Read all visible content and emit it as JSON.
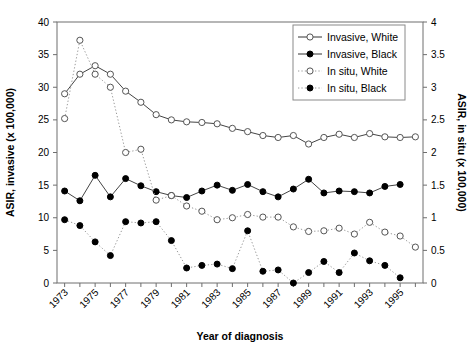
{
  "chart_data": {
    "type": "line",
    "title": "",
    "xlabel": "Year of diagnosis",
    "ylabel": "ASIR, invasive (x 100,000)",
    "y2label": "ASIR, in situ (x 100,000)",
    "x": [
      1973,
      1974,
      1975,
      1976,
      1977,
      1978,
      1979,
      1980,
      1981,
      1982,
      1983,
      1984,
      1985,
      1986,
      1987,
      1988,
      1989,
      1990,
      1991,
      1992,
      1993,
      1994,
      1995,
      1996
    ],
    "xlim": [
      1972.5,
      1996.5
    ],
    "ylim": [
      0,
      40
    ],
    "y2lim": [
      0,
      4
    ],
    "yticks": [
      0,
      5,
      10,
      15,
      20,
      25,
      30,
      35,
      40
    ],
    "y2ticks": [
      0,
      0.5,
      1,
      1.5,
      2,
      2.5,
      3,
      3.5,
      4
    ],
    "xticklabels": [
      "1973",
      "",
      "1975",
      "",
      "1977",
      "",
      "1979",
      "",
      "1981",
      "",
      "1983",
      "",
      "1985",
      "",
      "1987",
      "",
      "1989",
      "",
      "1991",
      "",
      "1993",
      "",
      "1995",
      ""
    ],
    "grid": false,
    "legend_position": "top-right",
    "series": [
      {
        "name": "Invasive, White",
        "axis": "left",
        "line": "solid",
        "marker": "open-circle",
        "values": [
          29.0,
          32.0,
          33.3,
          32.0,
          29.4,
          27.7,
          25.8,
          25.0,
          24.7,
          24.6,
          24.4,
          23.7,
          23.2,
          22.6,
          22.3,
          22.6,
          21.3,
          22.3,
          22.8,
          22.3,
          22.9,
          22.4,
          22.3,
          22.4
        ]
      },
      {
        "name": "Invasive, Black",
        "axis": "left",
        "line": "solid",
        "marker": "filled-circle",
        "values": [
          14.1,
          12.6,
          16.5,
          13.2,
          16.0,
          14.9,
          14.0,
          13.4,
          13.1,
          14.1,
          15.0,
          14.2,
          15.1,
          14.0,
          13.2,
          14.4,
          15.9,
          13.8,
          14.1,
          14.0,
          13.8,
          14.8,
          15.1,
          null
        ]
      },
      {
        "name": "In situ, White",
        "axis": "right",
        "line": "dotted",
        "marker": "open-circle",
        "values": [
          2.52,
          3.72,
          3.2,
          3.0,
          2.0,
          2.05,
          1.27,
          1.34,
          1.18,
          1.1,
          0.97,
          1.0,
          1.05,
          1.01,
          1.01,
          0.86,
          0.79,
          0.8,
          0.84,
          0.75,
          0.93,
          0.78,
          0.72,
          0.55
        ]
      },
      {
        "name": "In situ, Black",
        "axis": "right",
        "line": "dotted",
        "marker": "filled-circle",
        "values": [
          0.97,
          0.88,
          0.63,
          0.42,
          0.94,
          0.92,
          0.94,
          0.65,
          0.23,
          0.27,
          0.29,
          0.22,
          0.8,
          0.18,
          0.2,
          0.0,
          0.16,
          0.33,
          0.16,
          0.46,
          0.34,
          0.27,
          0.08,
          null
        ]
      }
    ]
  },
  "legend": {
    "items": [
      {
        "label": "Invasive, White"
      },
      {
        "label": "Invasive, Black"
      },
      {
        "label": "In situ, White"
      },
      {
        "label": "In situ, Black"
      }
    ]
  },
  "axes": {
    "left_title": "ASIR, invasive (x 100,000)",
    "right_title": "ASIR, in situ (x 100,000)",
    "x_title": "Year of diagnosis"
  }
}
